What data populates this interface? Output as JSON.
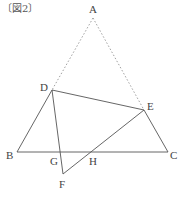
{
  "caption": "〔図2〕",
  "points": {
    "A": {
      "label": "A",
      "x": 93,
      "y": 18
    },
    "B": {
      "label": "B",
      "x": 17,
      "y": 152
    },
    "C": {
      "label": "C",
      "x": 168,
      "y": 152
    },
    "D": {
      "label": "D",
      "x": 52,
      "y": 90
    },
    "E": {
      "label": "E",
      "x": 144,
      "y": 110
    },
    "F": {
      "label": "F",
      "x": 63,
      "y": 174
    },
    "G": {
      "label": "G",
      "x": 60,
      "y": 152
    },
    "H": {
      "label": "H",
      "x": 91,
      "y": 152
    }
  },
  "segments": {
    "dotted": [
      "AD",
      "AE"
    ],
    "solid": [
      "DB",
      "BC",
      "EC",
      "DE",
      "DF",
      "EF"
    ]
  },
  "colors": {
    "line": "#555555",
    "dotted": "#888888",
    "label": "#444444"
  }
}
